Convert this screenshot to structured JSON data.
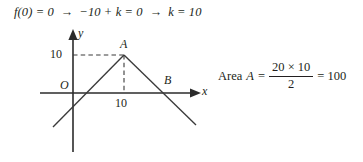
{
  "equation_line": {
    "step1": "f(0) = 0",
    "arrow1": "→",
    "step2": "−10 + k = 0",
    "arrow2": "→",
    "step3": "k = 10"
  },
  "graph": {
    "axis_label_y": "y",
    "axis_label_x": "x",
    "origin_label": "O",
    "vertex_label": "A",
    "root_label": "B",
    "y_tick_label": "10",
    "x_tick_label": "10",
    "line_color": "#3a3a3a",
    "axis_color": "#2b2b2b",
    "curve": {
      "type": "absolute-value-v-shape",
      "vertex": [
        10,
        10
      ],
      "y_intercept": 0,
      "x_intercept_right": 20,
      "description": "Inverted V peaking at (10,10), crossing x-axis at origin O and at B(20,0)"
    }
  },
  "area_formula": {
    "label": "Area",
    "variable": "A",
    "equals": "=",
    "numerator": "20 × 10",
    "denominator": "2",
    "equals2": "=",
    "result": "100"
  }
}
